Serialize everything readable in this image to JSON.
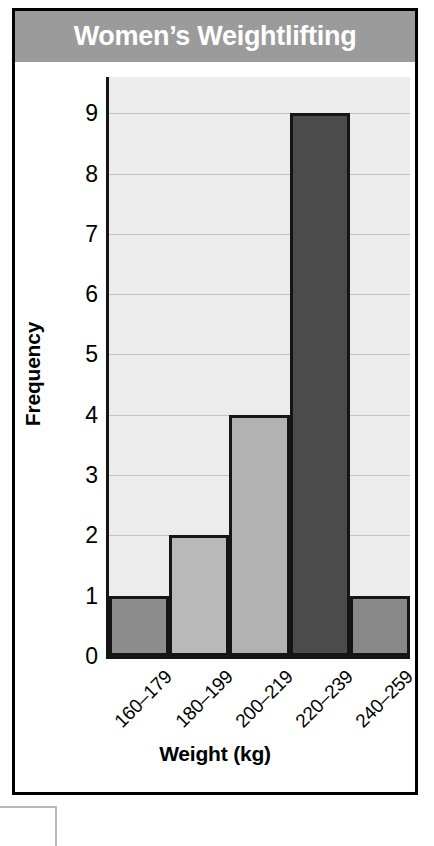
{
  "figure": {
    "title": "Women’s Weightlifting",
    "title_band_color": "#9b9b9b",
    "title_text_color": "#ffffff",
    "frame_color": "#000000"
  },
  "chart_data": {
    "type": "bar",
    "title": "Women’s Weightlifting",
    "xlabel": "Weight (kg)",
    "ylabel": "Frequency",
    "categories": [
      "160–179",
      "180–199",
      "200–219",
      "220–239",
      "240–259"
    ],
    "values": [
      1,
      2,
      4,
      9,
      1
    ],
    "bar_colors": [
      "#8d8d8d",
      "#b9b9b9",
      "#b2b2b2",
      "#4b4b4b",
      "#888888"
    ],
    "bar_edge_color": "#151515",
    "ylim": [
      0,
      9.6
    ],
    "yticks": [
      0,
      1,
      2,
      3,
      4,
      5,
      6,
      7,
      8,
      9
    ],
    "ytick_labels": [
      "0",
      "1",
      "2",
      "3",
      "4",
      "5",
      "6",
      "7",
      "8",
      "9"
    ],
    "grid": true,
    "gridline_color": "#c4c4c4",
    "plot_background": "#ececec",
    "legend": null,
    "xtick_rotation": -45
  }
}
